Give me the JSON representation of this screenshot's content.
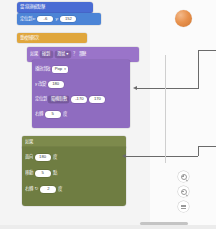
{
  "app": {
    "type": "block-based-visual-programming-editor",
    "workspace_background": "#f4f4f4",
    "accent_motion": "#4c84d6",
    "accent_event": "#4a6cd4",
    "accent_control": "#e0a63c",
    "accent_looks": "#8f6cc0",
    "accent_sensing": "#6f7d42",
    "sprite_color": "#e8924e"
  },
  "blocks": {
    "hat": {
      "label": "當 綠旗 被點擊"
    },
    "motion_goto": {
      "label": "定位到 x:",
      "x_value": "-6",
      "y_label": "y:",
      "y_value": "152"
    },
    "repeat": {
      "label": "重複無限次"
    },
    "purple_header": {
      "label_if": "如果",
      "operand_left": "碰到",
      "dropdown": "滑鼠 ▾",
      "label_q": "？",
      "label_then": "那麼"
    },
    "purple_rows": [
      {
        "label": "播放音效",
        "control": "dropdown",
        "value": "Pop"
      },
      {
        "label": "y 改變",
        "control": "oval",
        "value": "180"
      },
      {
        "label": "定位到",
        "control": "oval-pair",
        "inner_label": "隨機取數",
        "value": "-170",
        "value2": "170"
      },
      {
        "label": "右轉",
        "control": "oval",
        "value": "5",
        "suffix": "度"
      }
    ],
    "green_header": {
      "label": "如果"
    },
    "green_rows": [
      {
        "label": "面向",
        "control": "oval",
        "value": "180",
        "suffix": "度"
      },
      {
        "label": "移動",
        "control": "oval",
        "value": "5",
        "suffix": "點"
      },
      {
        "label": "右轉",
        "icon": "rotate-right-icon",
        "control": "oval",
        "value": "2",
        "suffix": "度"
      }
    ]
  },
  "controls": {
    "zoom_in": "zoom-in-icon",
    "zoom_out": "zoom-out-icon",
    "zoom_reset": "zoom-reset-icon"
  }
}
